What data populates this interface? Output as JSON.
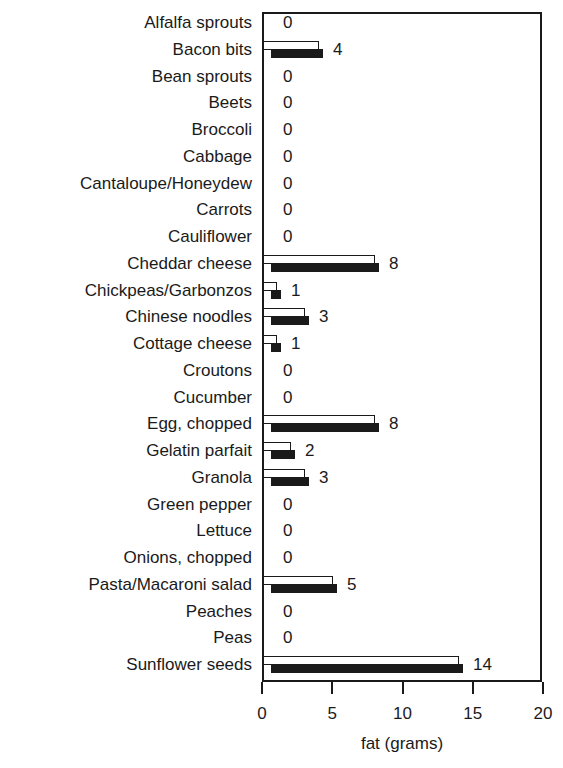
{
  "chart_data": {
    "type": "bar",
    "orientation": "horizontal",
    "title": "",
    "xlabel": "fat (grams)",
    "ylabel": "",
    "xlim": [
      0,
      20
    ],
    "xticks": [
      0,
      5,
      10,
      15,
      20
    ],
    "grid": false,
    "legend": null,
    "bar_style": "paired light/dark shadow bars per category",
    "categories": [
      "Alfalfa sprouts",
      "Bacon bits",
      "Bean sprouts",
      "Beets",
      "Broccoli",
      "Cabbage",
      "Cantaloupe/Honeydew",
      "Carrots",
      "Cauliflower",
      "Cheddar cheese",
      "Chickpeas/Garbonzos",
      "Chinese noodles",
      "Cottage cheese",
      "Croutons",
      "Cucumber",
      "Egg, chopped",
      "Gelatin parfait",
      "Granola",
      "Green pepper",
      "Lettuce",
      "Onions, chopped",
      "Pasta/Macaroni salad",
      "Peaches",
      "Peas",
      "Sunflower seeds"
    ],
    "values": [
      0,
      4,
      0,
      0,
      0,
      0,
      0,
      0,
      0,
      8,
      1,
      3,
      1,
      0,
      0,
      8,
      2,
      3,
      0,
      0,
      0,
      5,
      0,
      0,
      14
    ]
  },
  "axis": {
    "x_title": "fat (grams)",
    "ticks": [
      "0",
      "5",
      "10",
      "15",
      "20"
    ]
  }
}
